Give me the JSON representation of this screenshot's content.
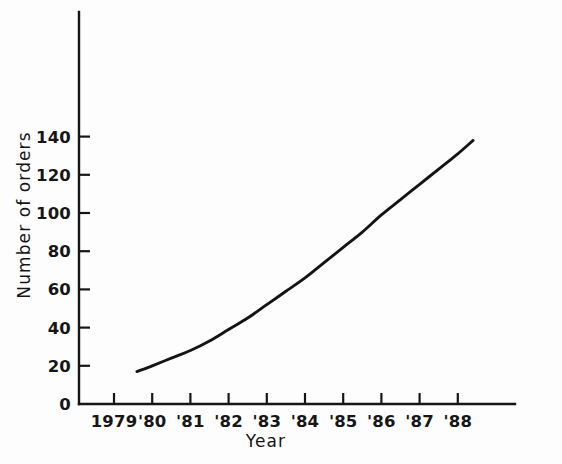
{
  "chart_data": {
    "type": "line",
    "title": "",
    "subtitle": "",
    "xlabel": "Year",
    "ylabel": "Number of orders",
    "grid": false,
    "legend": false,
    "legend_position": "none",
    "x_tick_labels": [
      "1979",
      "'80",
      "'81",
      "'82",
      "'83",
      "'84",
      "'85",
      "'86",
      "'87",
      "'88"
    ],
    "x_tick_values": [
      1979,
      1980,
      1981,
      1982,
      1983,
      1984,
      1985,
      1986,
      1987,
      1988
    ],
    "xlim": [
      1978.5,
      1989.9
    ],
    "y_tick_labels": [
      "0",
      "20",
      "40",
      "60",
      "80",
      "100",
      "120",
      "140"
    ],
    "y_tick_values": [
      0,
      20,
      40,
      60,
      80,
      100,
      120,
      140
    ],
    "ylim": [
      0,
      205
    ],
    "series": [
      {
        "name": "Number of orders",
        "color": "#141414",
        "x": [
          1979.6,
          1980,
          1980.5,
          1981,
          1981.5,
          1982,
          1982.5,
          1983,
          1983.5,
          1984,
          1984.5,
          1985,
          1985.5,
          1986,
          1986.5,
          1987,
          1987.5,
          1988,
          1988.4
        ],
        "values": [
          17,
          20,
          24,
          28,
          33,
          39,
          45,
          52,
          59,
          66,
          74,
          82,
          90,
          99,
          107,
          115,
          123,
          131,
          138
        ]
      }
    ]
  },
  "geometry": {
    "origin_x": 79,
    "origin_y": 404,
    "x_axis_end": 515,
    "y_axis_top": 12,
    "x_step_px": 38.2,
    "y_step_px": 38.2,
    "x_first_tick": 114,
    "y_tick_len": 11,
    "x_tick_len": 11
  },
  "labels": {
    "y_axis_title": "Number of orders",
    "x_axis_title": "Year"
  }
}
